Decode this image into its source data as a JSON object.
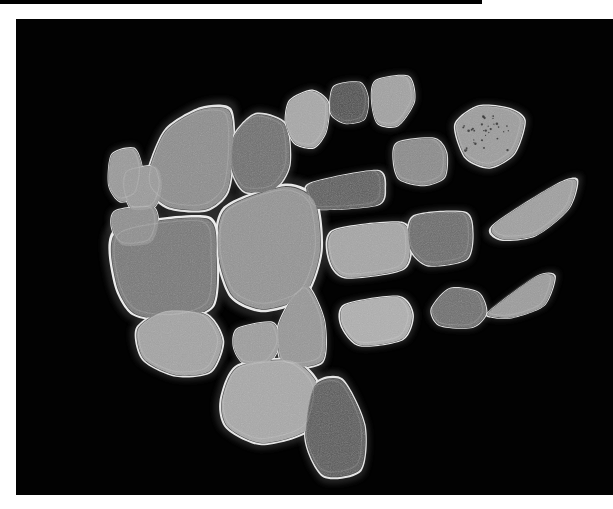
{
  "image": {
    "kind": "grayscale-specimen-plate",
    "background_color": "#020202",
    "page_background_color": "#ffffff",
    "top_strip_color": "#000000",
    "plate": {
      "x": 16,
      "y": 19,
      "width": 597,
      "height": 476
    },
    "top_strip": {
      "x": 0,
      "y": 0,
      "width": 482,
      "height": 4
    },
    "rim_color": "#e8e8e8",
    "halo_color": "#3a3a3a",
    "specimen_count": 24
  },
  "chart_data": {
    "type": "scatter",
    "title": "",
    "xlabel": "",
    "ylabel": "",
    "specimens": [
      {
        "id": "s01",
        "label": "small-left-wedge",
        "fill": "#9a9a9a",
        "rim": "#dcdcdc",
        "cx": 106,
        "cy": 152,
        "points": "96,136 118,130 126,150 121,176 104,182 93,166"
      },
      {
        "id": "s02",
        "label": "large-upper-left-slab",
        "fill": "#8d8d8d",
        "rim": "#e4e4e4",
        "cx": 175,
        "cy": 140,
        "points": "133,152 150,112 184,91 213,92 217,130 211,172 190,190 154,188 134,172"
      },
      {
        "id": "s03",
        "label": "mid-dark-trapezoid",
        "fill": "#6f6f6f",
        "rim": "#e0e0e0",
        "cx": 245,
        "cy": 132,
        "points": "218,118 240,96 269,106 273,146 258,170 229,172 216,150"
      },
      {
        "id": "s04",
        "label": "top-pale-pentagon",
        "fill": "#a8a8a8",
        "rim": "#e6e6e6",
        "cx": 292,
        "cy": 100,
        "points": "274,82 296,72 312,84 310,112 298,128 279,124 270,104"
      },
      {
        "id": "s05",
        "label": "top-dark-square",
        "fill": "#4e4e4e",
        "rim": "#dedede",
        "cx": 330,
        "cy": 83,
        "points": "318,68 344,64 352,80 348,100 329,104 315,94"
      },
      {
        "id": "s06",
        "label": "top-pale-triangle",
        "fill": "#a2a2a2",
        "rim": "#e2e2e2",
        "cx": 377,
        "cy": 84,
        "points": "360,62 392,58 398,82 382,106 362,104 356,82"
      },
      {
        "id": "s07",
        "label": "speckled-shield",
        "fill": "#9d9d9d",
        "rim": "#e6e6e6",
        "cx": 471,
        "cy": 116,
        "points": "440,106 462,88 492,90 508,102 498,134 474,148 450,138"
      },
      {
        "id": "s08",
        "label": "right-rounded-square",
        "fill": "#8b8b8b",
        "rim": "#dcdcdc",
        "cx": 405,
        "cy": 140,
        "points": "382,124 418,120 430,134 428,158 408,166 384,160 378,142"
      },
      {
        "id": "s09",
        "label": "mid-dark-bar",
        "fill": "#5d5d5d",
        "rim": "#e0e0e0",
        "cx": 336,
        "cy": 168,
        "points": "296,164 360,152 368,170 360,186 302,190 292,178"
      },
      {
        "id": "s10",
        "label": "center-large-block",
        "fill": "#949494",
        "rim": "#e8e8e8",
        "cx": 253,
        "cy": 235,
        "points": "210,190 268,168 298,182 304,232 288,276 248,290 216,276 202,232"
      },
      {
        "id": "s11",
        "label": "left-big-dark-slab",
        "fill": "#787878",
        "rim": "#ececec",
        "cx": 155,
        "cy": 248,
        "points": "102,212 190,200 200,238 196,286 160,300 118,294 100,262"
      },
      {
        "id": "s12",
        "label": "pale-rounded-rect",
        "fill": "#a6a6a6",
        "rim": "#e4e4e4",
        "cx": 352,
        "cy": 228,
        "points": "318,212 384,204 394,224 386,250 330,258 314,240"
      },
      {
        "id": "s13",
        "label": "right-mid-dark-block",
        "fill": "#6b6b6b",
        "rim": "#e0e0e0",
        "cx": 422,
        "cy": 218,
        "points": "398,198 448,194 456,214 450,240 412,246 394,228"
      },
      {
        "id": "s14",
        "label": "right-pale-wedge",
        "fill": "#a0a0a0",
        "rim": "#e2e2e2",
        "cx": 516,
        "cy": 196,
        "points": "478,206 540,166 560,162 552,190 520,216 486,220"
      },
      {
        "id": "s15",
        "label": "lower-left-pale-lobe",
        "fill": "#a4a4a4",
        "rim": "#e6e6e6",
        "cx": 168,
        "cy": 318,
        "points": "122,310 150,292 190,296 206,322 194,352 160,356 128,340"
      },
      {
        "id": "s16",
        "label": "small-pale-quad",
        "fill": "#9e9e9e",
        "rim": "#e0e0e0",
        "cx": 242,
        "cy": 322,
        "points": "222,310 256,304 264,324 252,344 228,344 218,328"
      },
      {
        "id": "s17",
        "label": "center-tall-triangle",
        "fill": "#979797",
        "rim": "#e4e4e4",
        "cx": 285,
        "cy": 310,
        "points": "292,268 308,302 306,342 268,346 262,310 276,280"
      },
      {
        "id": "s18",
        "label": "lower-mid-pale-lobe",
        "fill": "#b0b0b0",
        "rim": "#e8e8e8",
        "cx": 368,
        "cy": 298,
        "points": "330,286 382,278 396,296 386,320 344,326 326,306"
      },
      {
        "id": "s19",
        "label": "lower-right-pentagon",
        "fill": "#6e6e6e",
        "rim": "#dedede",
        "cx": 443,
        "cy": 288,
        "points": "416,290 434,270 462,274 470,294 456,308 424,306"
      },
      {
        "id": "s20",
        "label": "far-right-pale-wedge",
        "fill": "#9c9c9c",
        "rim": "#e2e2e2",
        "cx": 500,
        "cy": 278,
        "points": "474,292 520,258 538,258 528,286 498,298 478,298"
      },
      {
        "id": "s21",
        "label": "bottom-pale-slab",
        "fill": "#a9a9a9",
        "rim": "#e6e6e6",
        "cx": 255,
        "cy": 390,
        "points": "206,382 222,348 276,342 302,368 292,410 246,424 212,408"
      },
      {
        "id": "s22",
        "label": "bottom-dark-triangle",
        "fill": "#5a5a5a",
        "rim": "#e4e4e4",
        "cx": 312,
        "cy": 412,
        "points": "298,368 326,362 348,406 344,450 308,456 290,420"
      },
      {
        "id": "s23",
        "label": "left-lower-quad",
        "fill": "#8f8f8f",
        "rim": "#dcdcdc",
        "cx": 120,
        "cy": 206,
        "points": "100,192 136,188 142,206 134,224 106,226 96,208"
      },
      {
        "id": "s24",
        "label": "upper-left-small-wedge",
        "fill": "#9b9b9b",
        "rim": "#dedede",
        "cx": 126,
        "cy": 170,
        "points": "112,152 140,148 146,168 138,188 116,190 108,170"
      }
    ]
  }
}
